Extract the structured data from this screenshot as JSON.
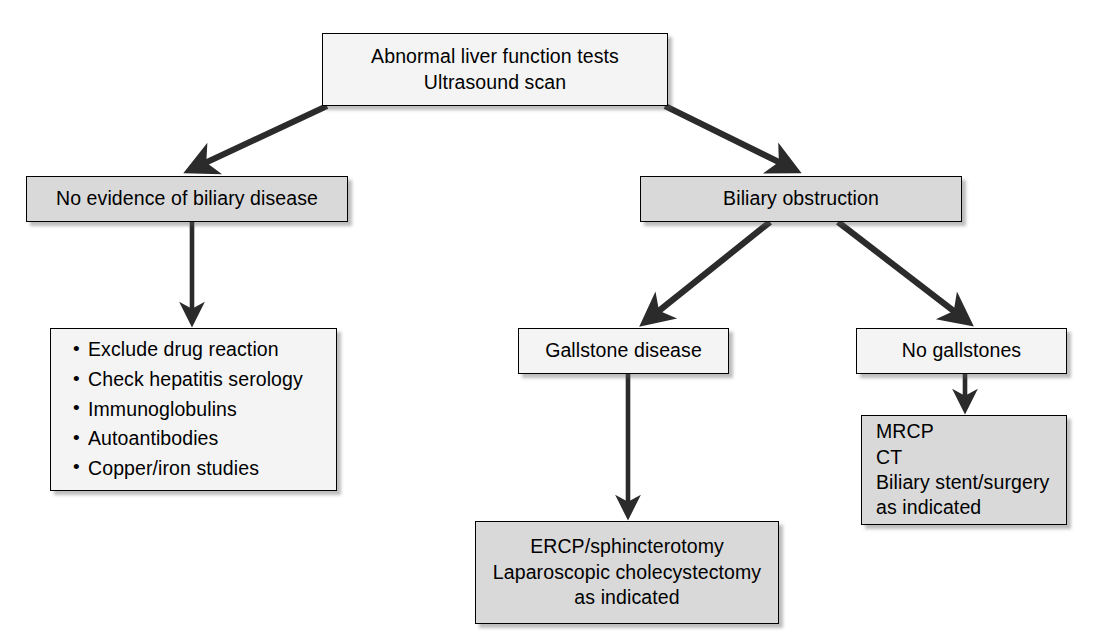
{
  "diagram": {
    "type": "flowchart",
    "colors": {
      "box_fill_light": "#f4f4f4",
      "box_fill_gray": "#d9d9d9",
      "border": "#000000",
      "arrow": "#2b2b2b",
      "background": "#ffffff"
    }
  },
  "nodes": {
    "top": {
      "id": "abnormal-lft",
      "fill": "light",
      "lines": [
        "Abnormal liver function tests",
        "Ultrasound scan"
      ]
    },
    "no_evidence": {
      "id": "no-evidence-biliary-disease",
      "fill": "gray",
      "lines": [
        "No evidence of biliary disease"
      ]
    },
    "biliary_obstruction": {
      "id": "biliary-obstruction",
      "fill": "gray",
      "lines": [
        "Biliary obstruction"
      ]
    },
    "workup": {
      "id": "non-biliary-workup",
      "fill": "light",
      "bullets": [
        "Exclude drug reaction",
        "Check hepatitis serology",
        "Immunoglobulins",
        "Autoantibodies",
        "Copper/iron studies"
      ]
    },
    "gallstone": {
      "id": "gallstone-disease",
      "fill": "light",
      "lines": [
        "Gallstone disease"
      ]
    },
    "no_gallstones": {
      "id": "no-gallstones",
      "fill": "light",
      "lines": [
        "No gallstones"
      ]
    },
    "mrcp": {
      "id": "mrcp-ct-stent",
      "fill": "gray",
      "lines": [
        "MRCP",
        "CT",
        "Biliary stent/surgery",
        "as indicated"
      ]
    },
    "ercp": {
      "id": "ercp-sphincterotomy",
      "fill": "gray",
      "lines": [
        "ERCP/sphincterotomy",
        "Laparoscopic cholecystectomy",
        "as indicated"
      ]
    }
  },
  "edges": [
    {
      "name": "top-to-no-evidence",
      "from": "top",
      "to": "no_evidence",
      "style": "diagonal"
    },
    {
      "name": "top-to-biliary-obstruction",
      "from": "top",
      "to": "biliary_obstruction",
      "style": "diagonal"
    },
    {
      "name": "no-evidence-to-workup",
      "from": "no_evidence",
      "to": "workup",
      "style": "vertical"
    },
    {
      "name": "biliary-to-gallstone",
      "from": "biliary_obstruction",
      "to": "gallstone",
      "style": "diagonal"
    },
    {
      "name": "biliary-to-no-gallstones",
      "from": "biliary_obstruction",
      "to": "no_gallstones",
      "style": "diagonal"
    },
    {
      "name": "gallstone-to-ercp",
      "from": "gallstone",
      "to": "ercp",
      "style": "vertical"
    },
    {
      "name": "no-gallstones-to-mrcp",
      "from": "no_gallstones",
      "to": "mrcp",
      "style": "vertical"
    }
  ]
}
